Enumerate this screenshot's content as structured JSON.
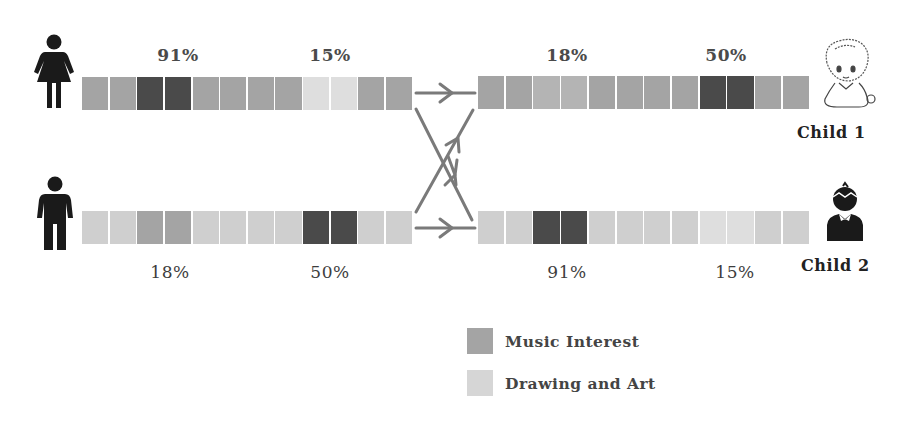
{
  "colors": {
    "dark": "#4a4a4a",
    "mid": "#a4a4a4",
    "mid_light": "#b4b4b4",
    "light": "#cfcfcf",
    "very_light": "#dedede",
    "arrow": "#7a7a7a",
    "icon": "#1a1a1a"
  },
  "parents": {
    "mother": {
      "icon": "female-person-icon"
    },
    "father": {
      "icon": "male-person-icon"
    }
  },
  "children": [
    {
      "label": "Child 1",
      "icon": "baby-icon"
    },
    {
      "label": "Child 2",
      "icon": "boy-icon"
    }
  ],
  "bars": {
    "mother": {
      "labels": [
        {
          "text": "91%",
          "cell_center": 3.5
        },
        {
          "text": "15%",
          "cell_center": 9.5
        }
      ],
      "cells": [
        "mid",
        "mid",
        "dark",
        "dark",
        "mid",
        "mid",
        "mid",
        "mid",
        "very_light",
        "very_light",
        "mid",
        "mid"
      ]
    },
    "father": {
      "labels": [
        {
          "text": "18%",
          "cell_center": 3.5
        },
        {
          "text": "50%",
          "cell_center": 9.5
        }
      ],
      "cells": [
        "light",
        "light",
        "mid",
        "mid",
        "light",
        "light",
        "light",
        "light",
        "dark",
        "dark",
        "light",
        "light"
      ]
    },
    "child1": {
      "labels": [
        {
          "text": "18%",
          "cell_center": 3.5
        },
        {
          "text": "50%",
          "cell_center": 9.5
        }
      ],
      "cells": [
        "mid",
        "mid",
        "mid_light",
        "mid_light",
        "mid",
        "mid",
        "mid",
        "mid",
        "dark",
        "dark",
        "mid",
        "mid"
      ]
    },
    "child2": {
      "labels": [
        {
          "text": "91%",
          "cell_center": 3.5
        },
        {
          "text": "15%",
          "cell_center": 9.5
        }
      ],
      "cells": [
        "light",
        "light",
        "dark",
        "dark",
        "light",
        "light",
        "light",
        "light",
        "very_light",
        "very_light",
        "light",
        "light"
      ]
    }
  },
  "legend": [
    {
      "label": "Music Interest",
      "color": "#a4a4a4"
    },
    {
      "label": "Drawing and Art",
      "color": "#d6d6d6"
    }
  ]
}
